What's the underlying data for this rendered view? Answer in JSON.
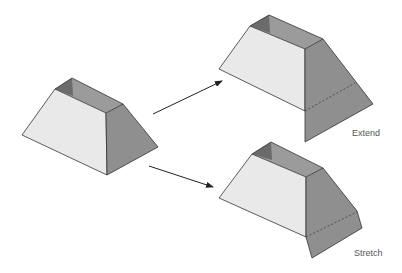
{
  "diagram": {
    "colors": {
      "front_face": "#e9e9e9",
      "right_face": "#8f8f8f",
      "inner_back": "#9b9b9b",
      "inner_left": "#6b6b6b",
      "edge": "#333333",
      "arrow": "#222222",
      "label": "#555555"
    },
    "nodes": [
      {
        "id": "original",
        "label": ""
      },
      {
        "id": "extend",
        "label": "Extend"
      },
      {
        "id": "stretch",
        "label": "Stretch"
      }
    ],
    "edges": [
      {
        "from": "original",
        "to": "extend"
      },
      {
        "from": "original",
        "to": "stretch"
      }
    ],
    "labels": {
      "extend": "Extend",
      "stretch": "Stretch"
    }
  }
}
